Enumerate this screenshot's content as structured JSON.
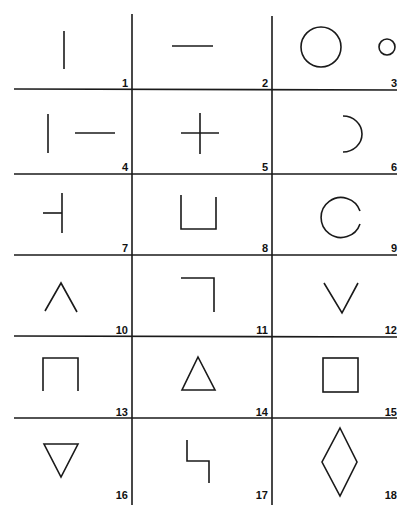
{
  "diagram": {
    "stroke_color": "#1a1a1a",
    "background": "#ffffff",
    "grid": {
      "columns": 3,
      "rows": 6,
      "v_lines": [
        132,
        272
      ],
      "h_lines": [
        89,
        174,
        255,
        336,
        418
      ],
      "left": 14,
      "right": 397,
      "top": 14,
      "bottom": 505
    },
    "cells": [
      {
        "number": "1",
        "shape": "vertical-line"
      },
      {
        "number": "2",
        "shape": "horizontal-line"
      },
      {
        "number": "3",
        "shape": "large-circle-and-small-circle"
      },
      {
        "number": "4",
        "shape": "vertical-line-and-horizontal-line"
      },
      {
        "number": "5",
        "shape": "plus-cross"
      },
      {
        "number": "6",
        "shape": "right-half-arc"
      },
      {
        "number": "7",
        "shape": "vertical-line-with-left-tick"
      },
      {
        "number": "8",
        "shape": "u-shape-open-top"
      },
      {
        "number": "9",
        "shape": "c-shape-open-right"
      },
      {
        "number": "10",
        "shape": "caret-up-chevron"
      },
      {
        "number": "11",
        "shape": "corner-top-right"
      },
      {
        "number": "12",
        "shape": "v-chevron-down"
      },
      {
        "number": "13",
        "shape": "n-shape-open-bottom"
      },
      {
        "number": "14",
        "shape": "triangle-up"
      },
      {
        "number": "15",
        "shape": "square"
      },
      {
        "number": "16",
        "shape": "triangle-down"
      },
      {
        "number": "17",
        "shape": "step-zigzag"
      },
      {
        "number": "18",
        "shape": "diamond"
      }
    ]
  }
}
